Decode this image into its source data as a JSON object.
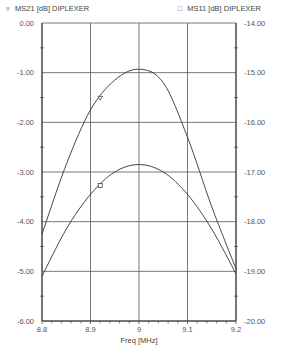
{
  "legend": [
    {
      "marker": "▿",
      "label": "MS21 [dB] DIPLEXER"
    },
    {
      "marker": "□",
      "label": "MS11 [dB] DIPLEXER"
    }
  ],
  "chart_data": {
    "type": "line",
    "title": "",
    "xlabel": "Freq [MHz]",
    "ylabel_left": "",
    "ylabel_right": "",
    "xlim": [
      8.8,
      9.2
    ],
    "ylim_left": [
      -6.0,
      0.0
    ],
    "ylim_right": [
      -20.0,
      -14.0
    ],
    "x_ticks": [
      "8.8",
      "8.9",
      "9",
      "9.1",
      "9.2"
    ],
    "y_ticks_left": [
      "0.00",
      "-1.00",
      "-2.00",
      "-3.00",
      "-4.00",
      "-5.00",
      "-6.00"
    ],
    "y_ticks_right": [
      "-14.00",
      "-15.00",
      "-16.00",
      "-17.00",
      "-18.00",
      "-19.00",
      "-20.00"
    ],
    "grid": true,
    "legend_position": "top",
    "x": [
      8.8,
      8.85,
      8.9,
      8.95,
      9.0,
      9.05,
      9.1,
      9.15,
      9.2
    ],
    "series": [
      {
        "name": "MS21 [dB] DIPLEXER",
        "axis": "left",
        "marker": "triangle-down",
        "marker_x": 8.92,
        "values": [
          -4.25,
          -2.85,
          -1.75,
          -1.15,
          -0.93,
          -1.2,
          -2.3,
          -3.7,
          -4.95
        ]
      },
      {
        "name": "MS11 [dB] DIPLEXER",
        "axis": "right",
        "marker": "square",
        "marker_x": 8.92,
        "values": [
          -19.1,
          -18.15,
          -17.45,
          -17.0,
          -16.85,
          -17.0,
          -17.45,
          -18.15,
          -19.05
        ]
      }
    ]
  },
  "plot": {
    "left": 42,
    "right": 236,
    "top": 23,
    "bottom": 321
  }
}
